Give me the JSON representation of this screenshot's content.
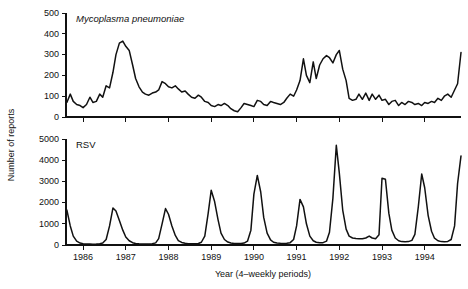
{
  "figure": {
    "background_color": "#ffffff",
    "line_color": "#111111",
    "y_axis_label": "Number of reports",
    "x_axis_label": "Year (4–weekly periods)"
  },
  "panels": {
    "top": {
      "title": "Mycoplasma pneumoniae",
      "title_style": "italic"
    },
    "bottom": {
      "title": "RSV",
      "title_style": "normal"
    }
  },
  "x_tick_labels": [
    "1986",
    "1987",
    "1988",
    "1989",
    "1990",
    "1991",
    "1992",
    "1993",
    "1994"
  ],
  "y_tick_labels_top": [
    "0",
    "100",
    "200",
    "300",
    "400",
    "500"
  ],
  "y_tick_labels_bottom": [
    "0",
    "1000",
    "2000",
    "3000",
    "4000",
    "5000"
  ],
  "chart_data": [
    {
      "type": "line",
      "title": "Mycoplasma pneumoniae",
      "xlabel": "Year (4-weekly periods)",
      "ylabel": "Number of reports",
      "ylim": [
        0,
        500
      ],
      "yticks": [
        0,
        100,
        200,
        300,
        400,
        500
      ],
      "xlim": [
        1985.6,
        1994.85
      ],
      "xticks": [
        1986,
        1987,
        1988,
        1989,
        1990,
        1991,
        1992,
        1993,
        1994
      ],
      "grid": false,
      "legend": "none",
      "x_unit": "4-weekly period",
      "series": [
        {
          "name": "Mycoplasma pneumoniae reports",
          "x": [
            1985.62,
            1985.7,
            1985.77,
            1985.85,
            1985.93,
            1986.0,
            1986.08,
            1986.16,
            1986.23,
            1986.31,
            1986.39,
            1986.46,
            1986.54,
            1986.62,
            1986.7,
            1986.77,
            1986.85,
            1986.93,
            1987.0,
            1987.08,
            1987.16,
            1987.23,
            1987.31,
            1987.39,
            1987.46,
            1987.54,
            1987.62,
            1987.7,
            1987.77,
            1987.85,
            1987.93,
            1988.0,
            1988.08,
            1988.16,
            1988.23,
            1988.31,
            1988.39,
            1988.46,
            1988.54,
            1988.62,
            1988.7,
            1988.77,
            1988.85,
            1988.93,
            1989.0,
            1989.08,
            1989.16,
            1989.23,
            1989.31,
            1989.39,
            1989.46,
            1989.54,
            1989.62,
            1989.7,
            1989.77,
            1989.85,
            1989.93,
            1990.0,
            1990.08,
            1990.16,
            1990.23,
            1990.31,
            1990.39,
            1990.46,
            1990.54,
            1990.62,
            1990.7,
            1990.77,
            1990.85,
            1990.93,
            1991.0,
            1991.08,
            1991.16,
            1991.23,
            1991.31,
            1991.39,
            1991.46,
            1991.54,
            1991.62,
            1991.7,
            1991.77,
            1991.85,
            1991.93,
            1992.0,
            1992.08,
            1992.16,
            1992.23,
            1992.31,
            1992.39,
            1992.46,
            1992.54,
            1992.62,
            1992.7,
            1992.77,
            1992.85,
            1992.93,
            1993.0,
            1993.08,
            1993.16,
            1993.23,
            1993.31,
            1993.39,
            1993.46,
            1993.54,
            1993.62,
            1993.7,
            1993.77,
            1993.85,
            1993.93,
            1994.0,
            1994.08,
            1994.16,
            1994.23,
            1994.31,
            1994.39,
            1994.46,
            1994.54,
            1994.62,
            1994.7,
            1994.77,
            1994.85
          ],
          "y": [
            70,
            110,
            75,
            60,
            55,
            45,
            60,
            95,
            70,
            75,
            110,
            95,
            150,
            140,
            215,
            300,
            355,
            365,
            340,
            320,
            250,
            185,
            145,
            120,
            110,
            105,
            115,
            120,
            130,
            170,
            160,
            145,
            140,
            150,
            135,
            120,
            125,
            110,
            95,
            90,
            105,
            95,
            75,
            70,
            55,
            50,
            60,
            55,
            65,
            55,
            40,
            30,
            25,
            45,
            65,
            60,
            55,
            50,
            80,
            75,
            60,
            55,
            75,
            70,
            65,
            60,
            70,
            90,
            110,
            100,
            130,
            175,
            280,
            200,
            165,
            265,
            185,
            250,
            280,
            295,
            285,
            260,
            300,
            320,
            230,
            175,
            90,
            80,
            85,
            110,
            85,
            115,
            80,
            110,
            85,
            105,
            80,
            85,
            60,
            75,
            80,
            55,
            70,
            60,
            75,
            70,
            60,
            65,
            55,
            70,
            65,
            75,
            70,
            90,
            80,
            100,
            110,
            95,
            130,
            160,
            310
          ]
        }
      ]
    },
    {
      "type": "line",
      "title": "RSV",
      "xlabel": "Year (4-weekly periods)",
      "ylabel": "Number of reports",
      "ylim": [
        0,
        5000
      ],
      "yticks": [
        0,
        1000,
        2000,
        3000,
        4000,
        5000
      ],
      "xlim": [
        1985.6,
        1994.85
      ],
      "xticks": [
        1986,
        1987,
        1988,
        1989,
        1990,
        1991,
        1992,
        1993,
        1994
      ],
      "grid": false,
      "legend": "none",
      "x_unit": "4-weekly period",
      "series": [
        {
          "name": "RSV reports",
          "x": [
            1985.62,
            1985.7,
            1985.77,
            1985.85,
            1985.93,
            1986.0,
            1986.08,
            1986.16,
            1986.23,
            1986.31,
            1986.39,
            1986.46,
            1986.54,
            1986.62,
            1986.7,
            1986.77,
            1986.85,
            1986.93,
            1987.0,
            1987.08,
            1987.16,
            1987.23,
            1987.31,
            1987.39,
            1987.46,
            1987.54,
            1987.62,
            1987.7,
            1987.77,
            1987.85,
            1987.93,
            1988.0,
            1988.08,
            1988.16,
            1988.23,
            1988.31,
            1988.39,
            1988.46,
            1988.54,
            1988.62,
            1988.7,
            1988.77,
            1988.85,
            1988.93,
            1989.0,
            1989.08,
            1989.16,
            1989.23,
            1989.31,
            1989.39,
            1989.46,
            1989.54,
            1989.62,
            1989.7,
            1989.77,
            1989.85,
            1989.93,
            1990.0,
            1990.08,
            1990.16,
            1990.23,
            1990.31,
            1990.39,
            1990.46,
            1990.54,
            1990.62,
            1990.7,
            1990.77,
            1990.85,
            1990.93,
            1991.0,
            1991.08,
            1991.16,
            1991.23,
            1991.31,
            1991.39,
            1991.46,
            1991.54,
            1991.62,
            1991.7,
            1991.77,
            1991.85,
            1991.93,
            1992.0,
            1992.08,
            1992.16,
            1992.23,
            1992.31,
            1992.39,
            1992.46,
            1992.54,
            1992.62,
            1992.7,
            1992.77,
            1992.85,
            1992.93,
            1993.0,
            1993.08,
            1993.16,
            1993.23,
            1993.31,
            1993.39,
            1993.46,
            1993.54,
            1993.62,
            1993.7,
            1993.77,
            1993.85,
            1993.93,
            1994.0,
            1994.08,
            1994.16,
            1994.23,
            1994.31,
            1994.39,
            1994.46,
            1994.54,
            1994.62,
            1994.7,
            1994.77,
            1994.85
          ],
          "y": [
            1650,
            900,
            420,
            180,
            90,
            60,
            50,
            45,
            40,
            45,
            60,
            90,
            260,
            900,
            1750,
            1600,
            1150,
            700,
            380,
            200,
            110,
            70,
            55,
            50,
            45,
            50,
            60,
            100,
            300,
            1000,
            1720,
            1450,
            900,
            450,
            210,
            120,
            80,
            60,
            55,
            55,
            70,
            130,
            420,
            1500,
            2580,
            2050,
            1200,
            560,
            260,
            140,
            95,
            75,
            70,
            70,
            90,
            180,
            700,
            2400,
            3280,
            2500,
            1300,
            560,
            240,
            130,
            95,
            80,
            75,
            80,
            110,
            260,
            900,
            2150,
            1800,
            1000,
            420,
            200,
            130,
            110,
            110,
            180,
            600,
            2200,
            4700,
            3400,
            1650,
            750,
            420,
            330,
            310,
            300,
            290,
            330,
            420,
            330,
            300,
            480,
            3150,
            3100,
            1500,
            700,
            330,
            200,
            160,
            150,
            160,
            220,
            500,
            1800,
            3350,
            2700,
            1400,
            650,
            320,
            200,
            160,
            150,
            170,
            260,
            900,
            2900,
            4200
          ]
        }
      ]
    }
  ]
}
